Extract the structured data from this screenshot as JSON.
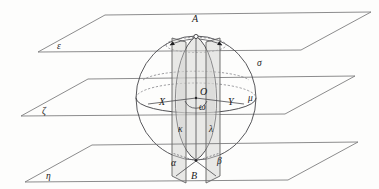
{
  "figure": {
    "background_color": "#fdfdfc",
    "line_color": "#45454a",
    "shade_color": "#d8d8d6"
  },
  "planes": [
    {
      "id": "epsilon",
      "label": "ε",
      "name": "top-plane",
      "position": "top"
    },
    {
      "id": "zeta",
      "label": "ζ",
      "name": "middle-plane",
      "position": "middle"
    },
    {
      "id": "eta",
      "label": "η",
      "name": "bottom-plane",
      "position": "bottom"
    }
  ],
  "points": [
    {
      "id": "A",
      "label": "A",
      "role": "north-pole"
    },
    {
      "id": "B",
      "label": "B",
      "role": "south-pole"
    },
    {
      "id": "O",
      "label": "O",
      "role": "sphere-center"
    },
    {
      "id": "X",
      "label": "X",
      "role": "equator-left"
    },
    {
      "id": "Y",
      "label": "Y",
      "role": "equator-right"
    }
  ],
  "curves": [
    {
      "id": "sigma",
      "label": "σ",
      "role": "sphere-surface"
    },
    {
      "id": "kappa",
      "label": "κ",
      "role": "left-great-circle-arc"
    },
    {
      "id": "lambda",
      "label": "λ",
      "role": "right-great-circle-arc"
    },
    {
      "id": "mu",
      "label": "μ",
      "role": "equator-circle"
    }
  ],
  "angles": [
    {
      "id": "omega",
      "label": "ω",
      "role": "dihedral-angle-at-center"
    },
    {
      "id": "alpha",
      "label": "α",
      "role": "angle-at-B-left"
    },
    {
      "id": "beta",
      "label": "β",
      "role": "angle-at-B-right"
    }
  ],
  "labels": {
    "A": "A",
    "B": "B",
    "O": "O",
    "X": "X",
    "Y": "Y",
    "sigma": "σ",
    "kappa": "κ",
    "lambda": "λ",
    "mu": "μ",
    "omega": "ω",
    "alpha": "α",
    "beta": "β",
    "epsilon": "ε",
    "zeta": "ζ",
    "eta": "η"
  }
}
